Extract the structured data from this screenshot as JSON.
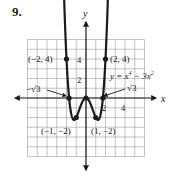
{
  "problem_number": "9.",
  "chart_data": {
    "type": "line",
    "title": "",
    "equation": "y = x⁴ − 3x²",
    "xlabel": "x",
    "ylabel": "y",
    "xlim": [
      -6,
      6
    ],
    "ylim": [
      -6,
      6
    ],
    "grid": true,
    "grid_step": 1,
    "x_tick_labels": [
      {
        "value": 2,
        "label": "2"
      },
      {
        "value": 4,
        "label": "4"
      }
    ],
    "y_tick_labels": [
      {
        "value": 2,
        "label": "2"
      },
      {
        "value": 4,
        "label": "4"
      }
    ],
    "series": [
      {
        "name": "y = x⁴ − 3x²",
        "function": "x^4 - 3x^2",
        "domain": [
          -2.28,
          2.28
        ],
        "arrows_at_ends": true
      }
    ],
    "points": [
      {
        "x": -2,
        "y": 4,
        "label": "(−2, 4)"
      },
      {
        "x": 2,
        "y": 4,
        "label": "(2, 4)"
      },
      {
        "x": -1,
        "y": -2,
        "label": "(−1, −2)"
      },
      {
        "x": 1,
        "y": -2,
        "label": "(1, −2)"
      },
      {
        "x": 0,
        "y": 0,
        "label": ""
      },
      {
        "x": -1.732,
        "y": 0,
        "label": ""
      },
      {
        "x": 1.732,
        "y": 0,
        "label": ""
      }
    ],
    "annotations": [
      {
        "text": "−√3",
        "points_to": [
          -1.732,
          0
        ]
      },
      {
        "text": "√3",
        "points_to": [
          1.732,
          0
        ]
      }
    ]
  },
  "labels": {
    "x_axis": "x",
    "y_axis": "y",
    "equation_lhs": "y = x",
    "equation_exp4": "4",
    "equation_rhs": " − 3x",
    "equation_exp2": "2",
    "neg_root": "−√3",
    "pos_root": "√3",
    "pt_m2_4": "(−2, 4)",
    "pt_2_4": "(2, 4)",
    "pt_m1_m2": "(−1, −2)",
    "pt_1_m2": "(1, −2)",
    "tick_x2": "2",
    "tick_x4": "4",
    "tick_y2": "2",
    "tick_y4": "4"
  }
}
